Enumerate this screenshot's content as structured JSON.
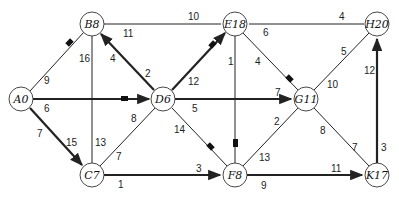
{
  "diagram": {
    "type": "weighted directed network (shortest path)",
    "nodes": [
      {
        "id": "A",
        "label": "A0",
        "x": 21,
        "y": 99
      },
      {
        "id": "B",
        "label": "B8",
        "x": 92,
        "y": 24
      },
      {
        "id": "C",
        "label": "C7",
        "x": 92,
        "y": 175
      },
      {
        "id": "D",
        "label": "D6",
        "x": 163,
        "y": 99
      },
      {
        "id": "E",
        "label": "E18",
        "x": 235,
        "y": 24
      },
      {
        "id": "F",
        "label": "F8",
        "x": 235,
        "y": 175
      },
      {
        "id": "G",
        "label": "G11",
        "x": 306,
        "y": 99
      },
      {
        "id": "H",
        "label": "H20",
        "x": 377,
        "y": 24
      },
      {
        "id": "K",
        "label": "K17",
        "x": 377,
        "y": 175
      }
    ],
    "edges": [
      {
        "from": "A",
        "to": "B",
        "labels": [
          "9"
        ],
        "bold": false
      },
      {
        "from": "A",
        "to": "D",
        "labels": [
          "6"
        ],
        "bold": true,
        "arrow": true
      },
      {
        "from": "A",
        "to": "C",
        "labels": [
          "7",
          "15"
        ],
        "bold": true,
        "arrow": true
      },
      {
        "from": "B",
        "to": "E",
        "labels": [
          "10",
          "11"
        ],
        "bold": false
      },
      {
        "from": "B",
        "to": "C",
        "labels": [
          "16",
          "13"
        ],
        "bold": false
      },
      {
        "from": "D",
        "to": "B",
        "labels": [
          "4",
          "2"
        ],
        "bold": true,
        "arrow": true
      },
      {
        "from": "D",
        "to": "E",
        "labels": [
          "12"
        ],
        "bold": true,
        "arrow": true
      },
      {
        "from": "D",
        "to": "G",
        "labels": [
          "5",
          "7"
        ],
        "bold": true,
        "arrow": true
      },
      {
        "from": "C",
        "to": "D",
        "labels": [
          "8",
          "7"
        ],
        "bold": false
      },
      {
        "from": "D",
        "to": "F",
        "labels": [
          "14"
        ],
        "bold": false
      },
      {
        "from": "C",
        "to": "F",
        "labels": [
          "1",
          "3"
        ],
        "bold": true,
        "arrow": true
      },
      {
        "from": "E",
        "to": "H",
        "labels": [
          "4",
          "6"
        ],
        "bold": false
      },
      {
        "from": "E",
        "to": "F",
        "labels": [
          "1"
        ],
        "bold": false
      },
      {
        "from": "E",
        "to": "G",
        "labels": [
          "4"
        ],
        "bold": false
      },
      {
        "from": "G",
        "to": "H",
        "labels": [
          "5",
          "10"
        ],
        "bold": false
      },
      {
        "from": "F",
        "to": "G",
        "labels": [
          "2",
          "13"
        ],
        "bold": false
      },
      {
        "from": "G",
        "to": "K",
        "labels": [
          "8",
          "7"
        ],
        "bold": false
      },
      {
        "from": "F",
        "to": "K",
        "labels": [
          "9",
          "11"
        ],
        "bold": true,
        "arrow": true
      },
      {
        "from": "K",
        "to": "H",
        "labels": [
          "3",
          "12"
        ],
        "bold": true,
        "arrow": true
      }
    ]
  },
  "labels": {
    "A0": "A0",
    "B8": "B8",
    "C7": "C7",
    "D6": "D6",
    "E18": "E18",
    "F8": "F8",
    "G11": "G11",
    "H20": "H20",
    "K17": "K17",
    "w_AB": "9",
    "w_AD": "6",
    "w_AC_1": "7",
    "w_AC_2": "15",
    "w_BE_1": "10",
    "w_BE_2": "11",
    "w_BC_1": "16",
    "w_BC_2": "13",
    "w_DB_1": "4",
    "w_DB_2": "2",
    "w_DE": "12",
    "w_DG_1": "5",
    "w_DG_2": "7",
    "w_CD_1": "8",
    "w_CD_2": "7",
    "w_DF": "14",
    "w_CF_1": "1",
    "w_CF_2": "3",
    "w_EH_1": "4",
    "w_EH_2": "6",
    "w_EF": "1",
    "w_EG": "4",
    "w_GH_1": "5",
    "w_GH_2": "10",
    "w_FG_1": "2",
    "w_FG_2": "13",
    "w_GK_1": "8",
    "w_GK_2": "7",
    "w_FK_1": "9",
    "w_FK_2": "11",
    "w_KH_1": "3",
    "w_KH_2": "12"
  }
}
